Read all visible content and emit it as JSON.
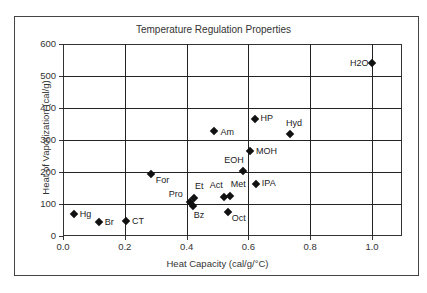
{
  "chart_data": {
    "type": "scatter",
    "title": "Temperature Regulation Properties",
    "xlabel": "Heat Capacity (cal/g/°C)",
    "ylabel": "Heat of Vaporization (cal/g)",
    "xlim": [
      0,
      1.1
    ],
    "ylim": [
      0,
      600
    ],
    "xticks": [
      "0.0",
      "0.2",
      "0.4",
      "0.6",
      "0.8",
      "1.0"
    ],
    "yticks": [
      "0",
      "100",
      "200",
      "300",
      "400",
      "500",
      "600"
    ],
    "grid": true,
    "legend": "none",
    "marker": "diamond",
    "points": [
      {
        "label": "H2O",
        "x": 1.0,
        "y": 540,
        "lx": -22,
        "ly": -5
      },
      {
        "label": "HP",
        "x": 0.62,
        "y": 366,
        "lx": 6,
        "ly": -6
      },
      {
        "label": "Am",
        "x": 0.49,
        "y": 329,
        "lx": 6,
        "ly": -4
      },
      {
        "label": "Hyd",
        "x": 0.735,
        "y": 318,
        "lx": -4,
        "ly": -16
      },
      {
        "label": "MOH",
        "x": 0.605,
        "y": 266,
        "lx": 6,
        "ly": -5
      },
      {
        "label": "EOH",
        "x": 0.583,
        "y": 203,
        "lx": -19,
        "ly": -16
      },
      {
        "label": "For",
        "x": 0.284,
        "y": 194,
        "lx": 5,
        "ly": 1
      },
      {
        "label": "IPA",
        "x": 0.624,
        "y": 161,
        "lx": 6,
        "ly": -6
      },
      {
        "label": "Et",
        "x": 0.424,
        "y": 118,
        "lx": 1,
        "ly": -17
      },
      {
        "label": "Act",
        "x": 0.52,
        "y": 123,
        "lx": -14,
        "ly": -17
      },
      {
        "label": "Met",
        "x": 0.54,
        "y": 125,
        "lx": 1,
        "ly": -17
      },
      {
        "label": "Pro",
        "x": 0.41,
        "y": 105,
        "lx": -21,
        "ly": -13
      },
      {
        "label": "Bz",
        "x": 0.42,
        "y": 95,
        "lx": 1,
        "ly": 4
      },
      {
        "label": "Oct",
        "x": 0.533,
        "y": 76,
        "lx": 4,
        "ly": 1
      },
      {
        "label": "Hg",
        "x": 0.035,
        "y": 69,
        "lx": 6,
        "ly": -5
      },
      {
        "label": "Br",
        "x": 0.116,
        "y": 45,
        "lx": 6,
        "ly": -5
      },
      {
        "label": "CT",
        "x": 0.204,
        "y": 48,
        "lx": 6,
        "ly": -5
      }
    ]
  }
}
